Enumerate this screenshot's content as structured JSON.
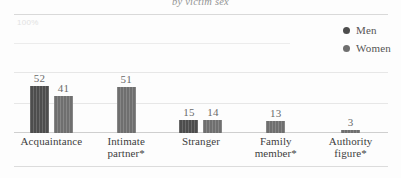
{
  "chart_data": {
    "type": "bar",
    "title": "by victim sex",
    "xlabel": "",
    "ylabel": "",
    "ylim": [
      0,
      100
    ],
    "grid": true,
    "gridlines": [
      100,
      75,
      50
    ],
    "legend_position": "top-right",
    "y_tick_labels": [
      "100%"
    ],
    "categories": [
      "Acquaintance",
      "Intimate partner*",
      "Stranger",
      "Family member*",
      "Authority figure*"
    ],
    "series": [
      {
        "name": "Men",
        "color": "#4d4d4d",
        "values": [
          52,
          null,
          15,
          null,
          null
        ],
        "labels": [
          "52",
          "",
          "15",
          "",
          ""
        ]
      },
      {
        "name": "Women",
        "color": "#6f6f6f",
        "values": [
          41,
          51,
          14,
          13,
          3
        ],
        "labels": [
          "41",
          "51",
          "14",
          "13",
          "3"
        ]
      }
    ]
  },
  "legend": {
    "items": [
      {
        "label": "Men",
        "color": "#4d4d4d"
      },
      {
        "label": "Women",
        "color": "#6f6f6f"
      }
    ]
  },
  "axis": {
    "top_tick": "100%"
  }
}
